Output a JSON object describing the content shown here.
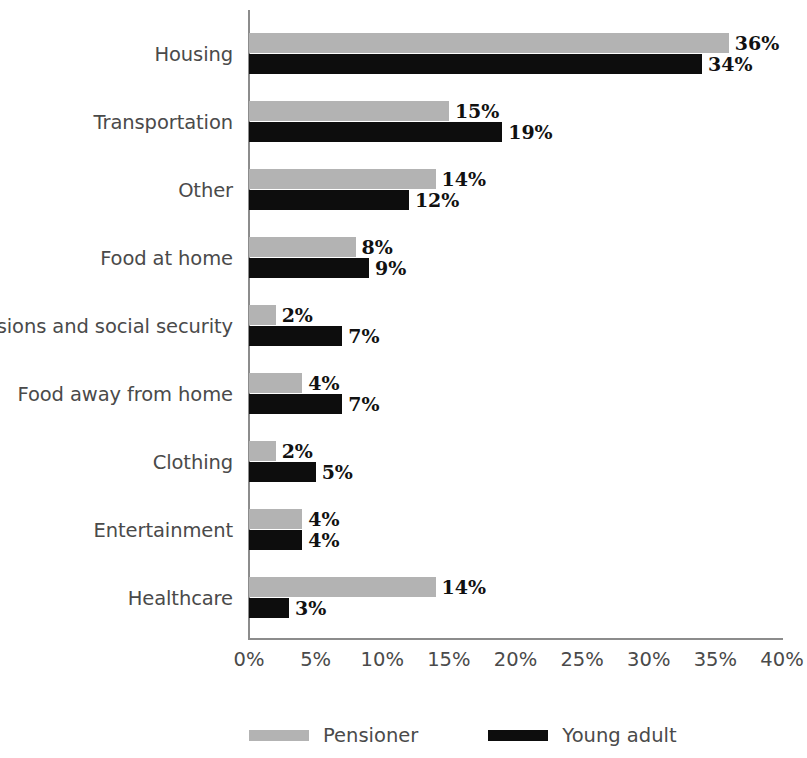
{
  "chart_data": {
    "type": "bar",
    "orientation": "horizontal",
    "title": "",
    "xlabel": "",
    "ylabel": "",
    "xlim": [
      0,
      40
    ],
    "xtick_labels": [
      "0%",
      "5%",
      "10%",
      "15%",
      "20%",
      "25%",
      "30%",
      "35%",
      "40%"
    ],
    "xtick_values": [
      0,
      5,
      10,
      15,
      20,
      25,
      30,
      35,
      40
    ],
    "grid": false,
    "legend_position": "bottom",
    "categories": [
      "Housing",
      "Transportation",
      "Other",
      "Food at home",
      "Pensions and social security",
      "Food away from home",
      "Clothing",
      "Entertainment",
      "Healthcare"
    ],
    "series": [
      {
        "name": "Pensioner",
        "color": "#b3b3b3",
        "values": [
          36,
          15,
          14,
          8,
          2,
          4,
          2,
          4,
          14
        ],
        "labels": [
          "36%",
          "15%",
          "14%",
          "8%",
          "2%",
          "4%",
          "2%",
          "4%",
          "14%"
        ]
      },
      {
        "name": "Young adult",
        "color": "#0d0d0d",
        "values": [
          34,
          19,
          12,
          9,
          7,
          7,
          5,
          4,
          3
        ],
        "labels": [
          "34%",
          "19%",
          "12%",
          "9%",
          "7%",
          "7%",
          "5%",
          "4%",
          "3%"
        ]
      }
    ]
  },
  "legend": {
    "items": [
      {
        "label": "Pensioner",
        "color": "#b3b3b3"
      },
      {
        "label": "Young adult",
        "color": "#0d0d0d"
      }
    ]
  },
  "colors": {
    "pensioner": "#b3b3b3",
    "young_adult": "#0d0d0d",
    "axis": "#8c8c8c",
    "text": "#4a4a4a",
    "value_text": "#111111",
    "background": "#ffffff"
  }
}
